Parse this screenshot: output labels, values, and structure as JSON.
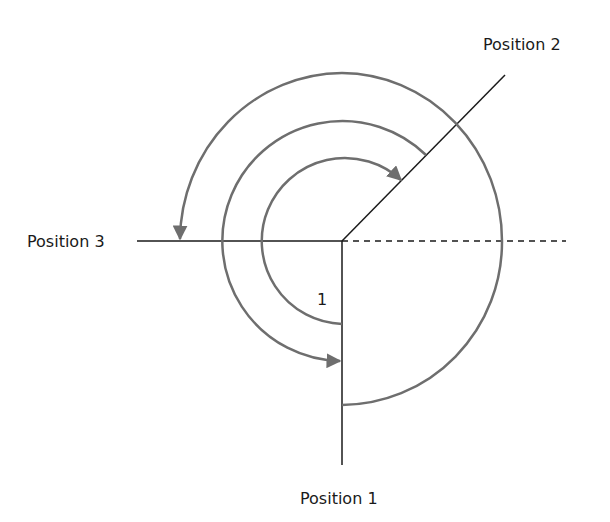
{
  "diagram": {
    "type": "rotation-positions",
    "labels": {
      "position_1": "Position 1",
      "position_2": "Position 2",
      "position_3": "Position 3",
      "angle_marker": "1"
    },
    "colors": {
      "line": "#1a1a1a",
      "arc": "#6e6e6e",
      "background": "#ffffff"
    }
  }
}
